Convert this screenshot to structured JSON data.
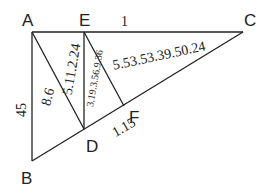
{
  "diagram": {
    "type": "geometry",
    "vertices": {
      "A": {
        "label": "A",
        "x": 32,
        "y": 32
      },
      "E": {
        "label": "E",
        "x": 84,
        "y": 32
      },
      "C": {
        "label": "C",
        "x": 243,
        "y": 32
      },
      "B": {
        "label": "B",
        "x": 32,
        "y": 161
      },
      "D": {
        "label": "D",
        "x": 84,
        "y": 129
      },
      "F": {
        "label": "F",
        "x": 124,
        "y": 106
      }
    },
    "segments": [
      {
        "from": "A",
        "to": "C"
      },
      {
        "from": "A",
        "to": "B"
      },
      {
        "from": "B",
        "to": "C"
      },
      {
        "from": "A",
        "to": "D"
      },
      {
        "from": "E",
        "to": "D"
      },
      {
        "from": "E",
        "to": "F"
      }
    ],
    "measure_labels": {
      "ec": "1",
      "ab": "45",
      "ad": "8.6",
      "ed_diag": "5.11.2.24",
      "ef": "3.19.3.56.9.36",
      "fc": "5.53.53.39.50.24",
      "df": "1.15"
    }
  }
}
